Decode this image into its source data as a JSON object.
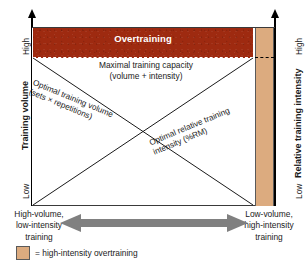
{
  "figure": {
    "colors": {
      "overtraining_red": "#9e2a10",
      "high_intensity_overtraining_tan": "#dcab7f",
      "arrow_gray": "#808080",
      "line_black": "#1a1a1a"
    }
  },
  "zones": {
    "overtraining_label": "Overtraining",
    "maximal_capacity_line1": "Maximal training capacity",
    "maximal_capacity_line2": "(volume + intensity)"
  },
  "curves": [
    {
      "name": "optimal-training-volume",
      "label_line1": "Optimal training volume",
      "label_line2": "(sets × repetitions)",
      "direction": "descending"
    },
    {
      "name": "optimal-relative-training-intensity",
      "label_line1": "Optimal relative training",
      "label_line2": "intensity (%RM)",
      "direction": "ascending"
    }
  ],
  "left_axis": {
    "title": "Training volume",
    "high": "High",
    "low": "Low"
  },
  "right_axis": {
    "title": "Relative training intensity",
    "high": "High",
    "low": "Low"
  },
  "bottom_axis": {
    "left_line1": "High-volume,",
    "left_line2": "low-intensity",
    "left_line3": "training",
    "right_line1": "Low-volume,",
    "right_line2": "high-intensity",
    "right_line3": "training"
  },
  "legend": {
    "swatch_name": "high-intensity-overtraining-swatch",
    "text": "= high-intensity overtraining"
  }
}
